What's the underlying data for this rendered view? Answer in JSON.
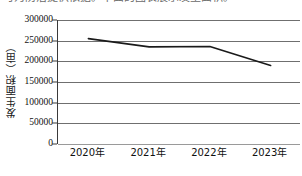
{
  "caption": {
    "text": "可为防治提供依据。下面的图表展示发生面积。"
  },
  "chart_data": {
    "type": "line",
    "title": "",
    "subtitle": "",
    "xlabel": "",
    "ylabel": "发生面积（亩）",
    "categories": [
      "2020年",
      "2021年",
      "2022年",
      "2023年"
    ],
    "values": [
      255000,
      235000,
      236000,
      190000
    ],
    "series": [
      {
        "name": "发生面积",
        "values": [
          255000,
          235000,
          236000,
          190000
        ]
      }
    ],
    "ylim": [
      0,
      300000
    ],
    "ytick_values": [
      0,
      50000,
      100000,
      150000,
      200000,
      250000,
      300000
    ],
    "ytick_labels": [
      "0",
      "50000",
      "100000",
      "150000",
      "200000",
      "250000",
      "300000"
    ],
    "grid": true,
    "grid_axis": "y",
    "legend": false,
    "legend_position": "none",
    "markers": false,
    "line_color": "#1a1a1a",
    "grid_color": "#6f6f6f",
    "axis_color": "#3a3a3a",
    "annotations": []
  }
}
